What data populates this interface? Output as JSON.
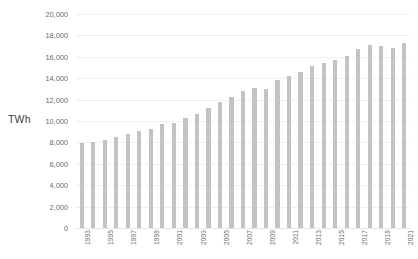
{
  "chart_data": {
    "type": "bar",
    "title": "",
    "subtitle": "",
    "xlabel": "",
    "ylabel": "TWh",
    "ylim": [
      0,
      20000
    ],
    "ytick_step": 2000,
    "ytick_labels": [
      "0",
      "2,000",
      "4,000",
      "6,000",
      "8,000",
      "10,000",
      "12,000",
      "14,000",
      "16,000",
      "18,000",
      "20,000"
    ],
    "ytick_values": [
      0,
      2000,
      4000,
      6000,
      8000,
      10000,
      12000,
      14000,
      16000,
      18000,
      20000
    ],
    "grid": true,
    "legend": "none",
    "bar_color": "#c3c3c3",
    "categories": [
      "1993",
      "1994",
      "1995",
      "1996",
      "1997",
      "1998",
      "1999",
      "2000",
      "2001",
      "2002",
      "2003",
      "2004",
      "2005",
      "2006",
      "2007",
      "2008",
      "2009",
      "2010",
      "2011",
      "2012",
      "2013",
      "2014",
      "2015",
      "2016",
      "2017",
      "2018",
      "2019",
      "2020",
      "2021"
    ],
    "values": [
      7900,
      8080,
      8250,
      8530,
      8800,
      9050,
      9300,
      9720,
      9850,
      10250,
      10700,
      11250,
      11750,
      12250,
      12850,
      13050,
      12950,
      13800,
      14250,
      14600,
      15100,
      15400,
      15700,
      16100,
      16700,
      17150,
      17000,
      16800,
      17250
    ],
    "labeled_categories": [
      "1993",
      "1995",
      "1997",
      "1999",
      "2001",
      "2003",
      "2005",
      "2007",
      "2009",
      "2011",
      "2013",
      "2015",
      "2017",
      "2019",
      "2021"
    ]
  }
}
